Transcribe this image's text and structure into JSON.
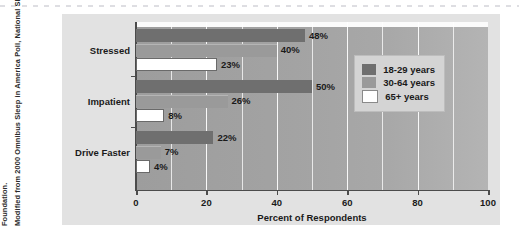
{
  "source_note": {
    "line1": "Modified from 2000 Omnibus Sleep in America Poll, National Sleep",
    "line2": "Foundation."
  },
  "chart_data": {
    "type": "bar",
    "orientation": "horizontal",
    "title": "",
    "xlabel": "Percent of Respondents",
    "ylabel": "",
    "xlim": [
      0,
      100
    ],
    "xticks": [
      0,
      20,
      40,
      60,
      80,
      100
    ],
    "xticklabels": [
      "0",
      "20",
      "40",
      "60",
      "80",
      "100"
    ],
    "grid": "vertical-minor-every-10",
    "legend_position": "upper-right-inside",
    "categories": [
      "Stressed",
      "Impatient",
      "Drive Faster"
    ],
    "series": [
      {
        "name": "18-29 years",
        "color": "#6f6f6f",
        "values": [
          48,
          50,
          22
        ],
        "labels": [
          "48%",
          "50%",
          "22%"
        ]
      },
      {
        "name": "30-64 years",
        "color": "#9a9a9a",
        "values": [
          40,
          26,
          7
        ],
        "labels": [
          "40%",
          "26%",
          "7%"
        ]
      },
      {
        "name": "65+ years",
        "color": "#ffffff",
        "values": [
          23,
          8,
          4
        ],
        "labels": [
          "23%",
          "8%",
          "4%"
        ]
      }
    ]
  },
  "legend": {
    "items": [
      {
        "label": "18-29 years",
        "swatch": "s0"
      },
      {
        "label": "30-64 years",
        "swatch": "s1"
      },
      {
        "label": "65+ years",
        "swatch": "s2"
      }
    ]
  }
}
